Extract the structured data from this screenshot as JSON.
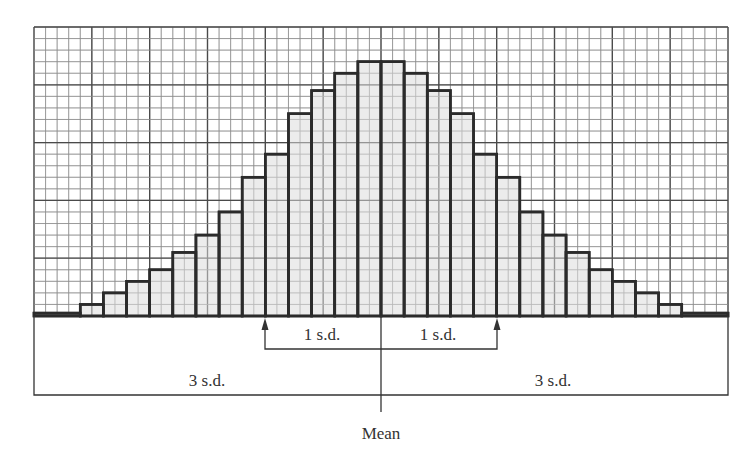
{
  "chart_data": {
    "type": "bar",
    "subtype": "histogram",
    "title": "",
    "xlabel": "",
    "ylabel": "",
    "grid": true,
    "legend": null,
    "bars": [
      {
        "x0": 0,
        "x1": 4,
        "height": 0.25
      },
      {
        "x0": 4,
        "x1": 6,
        "height": 1.0
      },
      {
        "x0": 6,
        "x1": 8,
        "height": 2.0
      },
      {
        "x0": 8,
        "x1": 10,
        "height": 3.0
      },
      {
        "x0": 10,
        "x1": 12,
        "height": 4.0
      },
      {
        "x0": 12,
        "x1": 14,
        "height": 5.5
      },
      {
        "x0": 14,
        "x1": 16,
        "height": 7.0
      },
      {
        "x0": 16,
        "x1": 18,
        "height": 9.0
      },
      {
        "x0": 18,
        "x1": 20,
        "height": 12.0
      },
      {
        "x0": 20,
        "x1": 22,
        "height": 14.0
      },
      {
        "x0": 22,
        "x1": 24,
        "height": 17.5
      },
      {
        "x0": 24,
        "x1": 26,
        "height": 19.5
      },
      {
        "x0": 26,
        "x1": 28,
        "height": 21.0
      },
      {
        "x0": 28,
        "x1": 30,
        "height": 22.0
      },
      {
        "x0": 30,
        "x1": 32,
        "height": 22.0
      },
      {
        "x0": 32,
        "x1": 34,
        "height": 21.0
      },
      {
        "x0": 34,
        "x1": 36,
        "height": 19.5
      },
      {
        "x0": 36,
        "x1": 38,
        "height": 17.5
      },
      {
        "x0": 38,
        "x1": 40,
        "height": 14.0
      },
      {
        "x0": 40,
        "x1": 42,
        "height": 12.0
      },
      {
        "x0": 42,
        "x1": 44,
        "height": 9.0
      },
      {
        "x0": 44,
        "x1": 46,
        "height": 7.0
      },
      {
        "x0": 46,
        "x1": 48,
        "height": 5.5
      },
      {
        "x0": 48,
        "x1": 50,
        "height": 4.0
      },
      {
        "x0": 50,
        "x1": 52,
        "height": 3.0
      },
      {
        "x0": 52,
        "x1": 54,
        "height": 2.0
      },
      {
        "x0": 54,
        "x1": 56,
        "height": 1.0
      },
      {
        "x0": 56,
        "x1": 60,
        "height": 0.25
      }
    ],
    "units": "grid cells",
    "xlim": [
      0,
      60
    ],
    "ylim": [
      0,
      25
    ],
    "grid_cells": {
      "columns": 60,
      "rows": 25,
      "major_every": 5
    },
    "mean_x": 30,
    "annotations": [
      {
        "text": "1 s.d.",
        "from": 20,
        "to": 30,
        "side": "left",
        "arrow": "up"
      },
      {
        "text": "1 s.d.",
        "from": 30,
        "to": 40,
        "side": "right",
        "arrow": "up"
      },
      {
        "text": "3 s.d.",
        "from": 0,
        "to": 30,
        "side": "left"
      },
      {
        "text": "3 s.d.",
        "from": 30,
        "to": 60,
        "side": "right"
      },
      {
        "text": "Mean",
        "at": 30
      }
    ]
  },
  "labels": {
    "sd1_left": "1 s.d.",
    "sd1_right": "1 s.d.",
    "sd3_left": "3 s.d.",
    "sd3_right": "3 s.d.",
    "mean": "Mean"
  },
  "colors": {
    "bar_fill": "#e6e6e6",
    "bar_stroke": "#2b2b2b",
    "grid_minor": "#8a8a8a",
    "grid_major": "#4a4a4a",
    "annotation": "#333333"
  }
}
